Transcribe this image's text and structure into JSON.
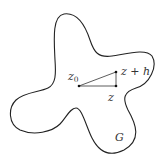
{
  "figure": {
    "region_label": "G",
    "points": [
      {
        "id": "z0",
        "label": "z",
        "subscript": "0",
        "x": 79,
        "y": 86
      },
      {
        "id": "z_plus_h",
        "label": "z + h",
        "x": 116,
        "y": 72
      },
      {
        "id": "z",
        "label": "z",
        "x": 116,
        "y": 86
      }
    ],
    "colors": {
      "stroke": "#222222",
      "text": "#333333",
      "background": "#ffffff"
    }
  }
}
